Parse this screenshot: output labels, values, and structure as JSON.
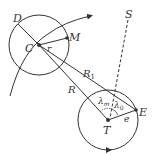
{
  "diagram": {
    "labels": {
      "D": "D",
      "C": "C",
      "M": "M",
      "r": "r",
      "S": "S",
      "R1": "R",
      "R1_sub": "1",
      "R": "R",
      "lambda_m": "λ",
      "lambda_m_sub": "m",
      "lambda_0": "λ",
      "lambda_0_sub": "0",
      "E": "E",
      "e": "e",
      "T": "T"
    },
    "colors": {
      "stroke": "#333333",
      "background": "#ffffff"
    }
  }
}
